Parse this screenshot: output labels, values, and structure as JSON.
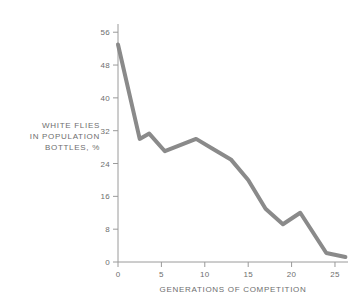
{
  "chart_data": {
    "type": "line",
    "title": "",
    "xlabel": "GENERATIONS OF COMPETITION",
    "ylabel": "WHITE FLIES IN POPULATION BOTTLES, %",
    "ylabel_lines": [
      "WHITE FLIES",
      "IN POPULATION",
      "BOTTLES, %"
    ],
    "xlim": [
      0,
      26.5
    ],
    "ylim": [
      0,
      58
    ],
    "xticks": [
      0,
      5,
      10,
      15,
      20,
      25
    ],
    "yticks": [
      0,
      8,
      16,
      24,
      32,
      40,
      48,
      56
    ],
    "xtick_labels": [
      "0",
      "5",
      "10",
      "15",
      "20",
      "25"
    ],
    "ytick_labels": [
      "0",
      "8",
      "16",
      "24",
      "32",
      "40",
      "48",
      "56"
    ],
    "grid": false,
    "legend": false,
    "line_color": "#8a8a8a",
    "line_width": 4,
    "axis_color": "#9a9a9a",
    "text_color": "#6e6e6e",
    "background": "#ffffff",
    "series": [
      {
        "name": "White flies in population bottles",
        "x": [
          0,
          2.5,
          3.6,
          5.4,
          9.0,
          11.0,
          13.0,
          15.0,
          17.0,
          19.0,
          21.0,
          24.0,
          26.2
        ],
        "y": [
          53.0,
          30.0,
          31.3,
          27.0,
          30.0,
          27.5,
          25.0,
          20.0,
          13.0,
          9.2,
          12.0,
          2.2,
          1.2
        ]
      }
    ]
  }
}
